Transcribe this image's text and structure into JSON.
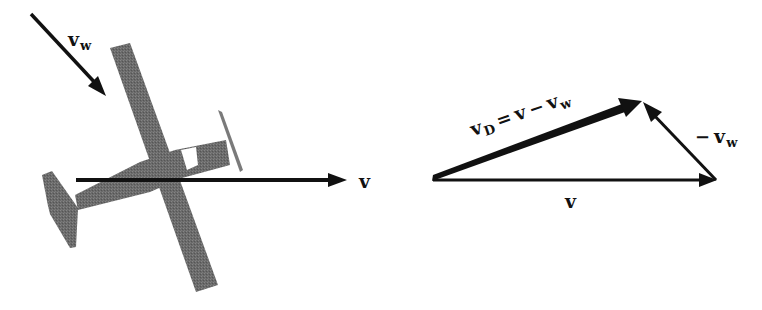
{
  "figure": {
    "left_panel": {
      "description": "Top view of light airplane flying with wind",
      "wind_vector_label": {
        "symbol": "v",
        "subscript": "w"
      },
      "velocity_vector_label": {
        "symbol": "v"
      }
    },
    "right_panel": {
      "description": "Vector triangle",
      "vd_label": {
        "symbol": "v",
        "subscript": "D",
        "equals": "=",
        "rhs_symbol": "v",
        "minus": "−",
        "rhs2_symbol": "v",
        "rhs2_subscript": "w"
      },
      "neg_wind_label": {
        "minus": "−",
        "symbol": "v",
        "subscript": "w"
      },
      "base_label": {
        "symbol": "v"
      }
    }
  },
  "colors": {
    "arrow": "#111111",
    "airplane": "#6e6e6e",
    "background": "#ffffff"
  }
}
